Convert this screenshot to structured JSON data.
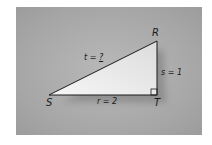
{
  "figure": {
    "vertices": {
      "R": {
        "label": "R",
        "x": 157,
        "y": 41
      },
      "S": {
        "label": "S",
        "x": 49,
        "y": 95
      },
      "T": {
        "label": "T",
        "x": 157,
        "y": 95
      }
    },
    "sides": {
      "t": {
        "label": "t = ?",
        "var": "t",
        "value": "?"
      },
      "s": {
        "label": "s = 1",
        "var": "s",
        "value": "1"
      },
      "r": {
        "label": "r = 2",
        "var": "r",
        "value": "2"
      }
    },
    "right_angle_at": "T",
    "colors": {
      "background": "#a8a8a8",
      "triangle_fill": "#ececec",
      "stroke": "#1a1a1a"
    }
  }
}
